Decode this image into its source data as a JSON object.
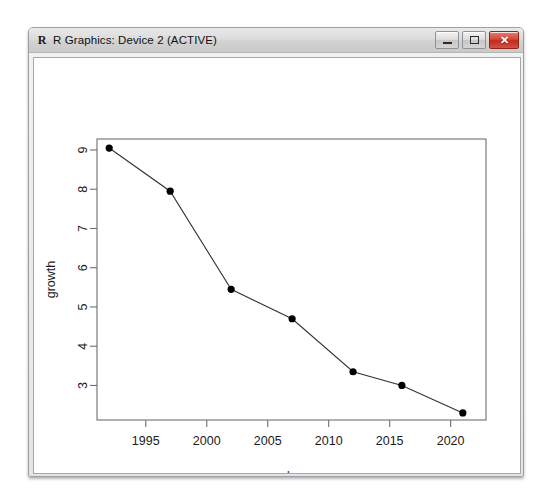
{
  "window": {
    "title": "R Graphics: Device 2 (ACTIVE)",
    "icon": "r-logo-icon",
    "buttons": {
      "minimize_label": "─",
      "maximize_label": "□",
      "close_label": "✕"
    }
  },
  "colors": {
    "point": "#000000",
    "line": "#333333",
    "axis": "#6f6f6f",
    "canvas": "#ffffff",
    "title_bar": "#dcdcdc",
    "close_button": "#d6483a"
  },
  "chart_data": {
    "type": "line",
    "title": "",
    "xlabel": "endyear",
    "ylabel": "growth",
    "x": [
      1992,
      1997,
      2002,
      2007,
      2012,
      2016,
      2021
    ],
    "values": [
      9.05,
      7.95,
      5.45,
      4.7,
      3.35,
      3.0,
      2.3
    ],
    "xticks": [
      1995,
      2000,
      2005,
      2010,
      2015,
      2020
    ],
    "yticks": [
      3,
      4,
      5,
      6,
      7,
      8,
      9
    ],
    "xlim": [
      1991.0,
      2022.9
    ],
    "ylim": [
      2.12,
      9.28
    ],
    "grid": false,
    "legend": null,
    "marker": "filled-circle",
    "series": [
      {
        "name": "growth",
        "values": [
          9.05,
          7.95,
          5.45,
          4.7,
          3.35,
          3.0,
          2.3
        ]
      }
    ]
  }
}
